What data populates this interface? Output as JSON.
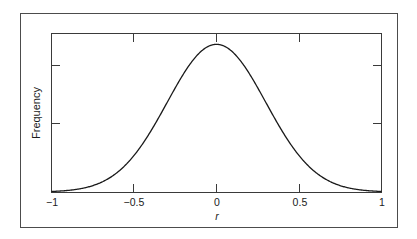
{
  "figure": {
    "background_color": "#ffffff",
    "border_color": "#4c4c4c",
    "frame_color": "#3a3a3a",
    "curve_color": "#1a1a1a"
  },
  "axes": {
    "x_title": "r",
    "y_title": "Frequency",
    "x_tick_labels": [
      "−1",
      "−0.5",
      "0",
      "0.5",
      "1"
    ],
    "x_tick_values": [
      -1,
      -0.5,
      0,
      0.5,
      1
    ],
    "y_tick_labels": [
      "",
      ""
    ],
    "y_tick_values": [
      0.55,
      0.25
    ]
  },
  "chart_data": {
    "type": "line",
    "title": "",
    "subtitle": "",
    "xlabel": "r",
    "ylabel": "Frequency",
    "xlim": [
      -1,
      1
    ],
    "ylim": [
      0,
      1.07
    ],
    "grid": false,
    "legend": null,
    "x_ticks": [
      -1,
      -0.5,
      0,
      0.5,
      1
    ],
    "x_tick_labels": [
      "−1",
      "−0.5",
      "0",
      "0.5",
      "1"
    ],
    "y_ticks": [
      0.25,
      0.55
    ],
    "y_tick_labels": [
      "",
      ""
    ],
    "annotations": [],
    "series": [
      {
        "name": "frequency distribution of r",
        "color": "#1a1a1a",
        "peak_x": 0,
        "peak_y": 1.0,
        "sigma": 0.3,
        "x": [
          -1.0,
          -0.95,
          -0.9,
          -0.85,
          -0.8,
          -0.75,
          -0.7,
          -0.65,
          -0.6,
          -0.55,
          -0.5,
          -0.45,
          -0.4,
          -0.35,
          -0.3,
          -0.25,
          -0.2,
          -0.15,
          -0.1,
          -0.05,
          0.0,
          0.05,
          0.1,
          0.15,
          0.2,
          0.25,
          0.3,
          0.35,
          0.4,
          0.45,
          0.5,
          0.55,
          0.6,
          0.65,
          0.7,
          0.75,
          0.8,
          0.85,
          0.9,
          0.95,
          1.0
        ],
        "y": [
          0.004,
          0.007,
          0.011,
          0.018,
          0.028,
          0.044,
          0.066,
          0.097,
          0.135,
          0.184,
          0.249,
          0.325,
          0.411,
          0.507,
          0.607,
          0.707,
          0.801,
          0.882,
          0.946,
          0.986,
          1.0,
          0.986,
          0.946,
          0.882,
          0.801,
          0.707,
          0.607,
          0.507,
          0.411,
          0.325,
          0.249,
          0.184,
          0.135,
          0.097,
          0.066,
          0.044,
          0.028,
          0.018,
          0.011,
          0.007,
          0.004
        ]
      }
    ]
  }
}
